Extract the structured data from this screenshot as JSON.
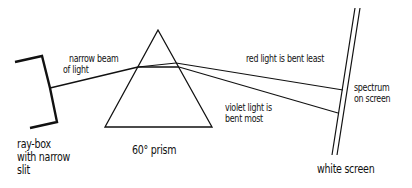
{
  "diagram": {
    "labels": {
      "beam": [
        "narrow beam",
        "of light"
      ],
      "red": "red light is bent least",
      "violet": [
        "violet light is",
        "bent most"
      ],
      "spectrum": [
        "spectrum",
        "on screen"
      ],
      "raybox": [
        "ray-box",
        "with narrow",
        "slit"
      ],
      "prism": "60° prism",
      "screen": "white screen"
    },
    "colors": {
      "ink": "#111111",
      "background": "#ffffff"
    }
  }
}
